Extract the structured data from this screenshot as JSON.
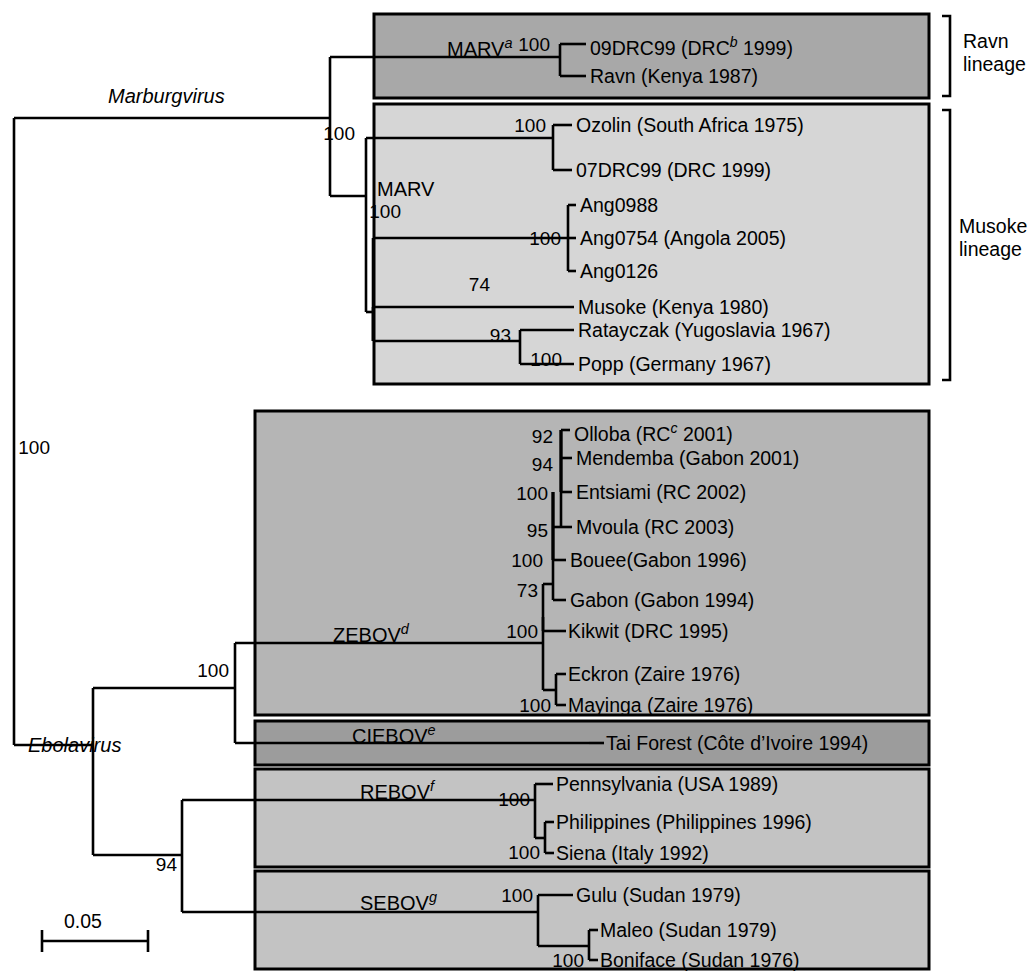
{
  "figure": {
    "type": "phylogenetic-tree",
    "scale_bar": {
      "label": "0.05",
      "units": "substitutions per site"
    },
    "genera": [
      {
        "id": "marburgvirus",
        "name": "Marburgvirus"
      },
      {
        "id": "ebolavirus",
        "name": "Ebolavirus"
      }
    ],
    "lineage_brackets": [
      {
        "id": "ravn",
        "label": "Ravn\nlineage",
        "line1": "Ravn",
        "line2": "lineage"
      },
      {
        "id": "musoke",
        "label": "Musoke\nlineage",
        "line1": "Musoke",
        "line2": "lineage"
      }
    ],
    "clade_boxes": [
      {
        "id": "ravn-box",
        "label": "MARV",
        "superscript": "a",
        "shade": "#a8a8a8"
      },
      {
        "id": "musoke-box",
        "label": "MARV",
        "superscript": "",
        "shade": "#d4d4d4"
      },
      {
        "id": "zebov-box",
        "label": "ZEBOV",
        "superscript": "d",
        "shade": "#b4b4b4"
      },
      {
        "id": "ciebov-box",
        "label": "CIEBOV",
        "superscript": "e",
        "shade": "#9a9a9a"
      },
      {
        "id": "rebov-box",
        "label": "REBOV",
        "superscript": "f",
        "shade": "#c2c2c2"
      },
      {
        "id": "sebov-box",
        "label": "SEBOV",
        "superscript": "g",
        "shade": "#c2c2c2"
      }
    ],
    "taxa": [
      {
        "id": "t01",
        "label": "09DRC99 (DRC",
        "superscript": "b",
        "tail": " 1999)",
        "clade": "ravn-box"
      },
      {
        "id": "t02",
        "label": "Ravn (Kenya 1987)",
        "superscript": "",
        "tail": "",
        "clade": "ravn-box"
      },
      {
        "id": "t03",
        "label": "Ozolin (South Africa 1975)",
        "superscript": "",
        "tail": "",
        "clade": "musoke-box"
      },
      {
        "id": "t04",
        "label": "07DRC99 (DRC 1999)",
        "superscript": "",
        "tail": "",
        "clade": "musoke-box"
      },
      {
        "id": "t05",
        "label": "Ang0988",
        "superscript": "",
        "tail": "",
        "clade": "musoke-box"
      },
      {
        "id": "t06",
        "label": "Ang0754 (Angola 2005)",
        "superscript": "",
        "tail": "",
        "clade": "musoke-box"
      },
      {
        "id": "t07",
        "label": "Ang0126",
        "superscript": "",
        "tail": "",
        "clade": "musoke-box"
      },
      {
        "id": "t08",
        "label": "Musoke (Kenya 1980)",
        "superscript": "",
        "tail": "",
        "clade": "musoke-box"
      },
      {
        "id": "t09",
        "label": "Ratayczak (Yugoslavia 1967)",
        "superscript": "",
        "tail": "",
        "clade": "musoke-box"
      },
      {
        "id": "t10",
        "label": "Popp (Germany 1967)",
        "superscript": "",
        "tail": "",
        "clade": "musoke-box"
      },
      {
        "id": "t11",
        "label": "Olloba (RC",
        "superscript": "c",
        "tail": " 2001)",
        "clade": "zebov-box"
      },
      {
        "id": "t12",
        "label": "Mendemba (Gabon 2001)",
        "superscript": "",
        "tail": "",
        "clade": "zebov-box"
      },
      {
        "id": "t13",
        "label": "Entsiami (RC 2002)",
        "superscript": "",
        "tail": "",
        "clade": "zebov-box"
      },
      {
        "id": "t14",
        "label": "Mvoula (RC 2003)",
        "superscript": "",
        "tail": "",
        "clade": "zebov-box"
      },
      {
        "id": "t15",
        "label": "Bouee(Gabon 1996)",
        "superscript": "",
        "tail": "",
        "clade": "zebov-box"
      },
      {
        "id": "t16",
        "label": "Gabon (Gabon 1994)",
        "superscript": "",
        "tail": "",
        "clade": "zebov-box"
      },
      {
        "id": "t17",
        "label": "Kikwit (DRC 1995)",
        "superscript": "",
        "tail": "",
        "clade": "zebov-box"
      },
      {
        "id": "t18",
        "label": "Eckron (Zaire 1976)",
        "superscript": "",
        "tail": "",
        "clade": "zebov-box"
      },
      {
        "id": "t19",
        "label": "Mayinga (Zaire 1976)",
        "superscript": "",
        "tail": "",
        "clade": "zebov-box"
      },
      {
        "id": "t20",
        "label": "Tai Forest (Côte d’Ivoire 1994)",
        "superscript": "",
        "tail": "",
        "clade": "ciebov-box"
      },
      {
        "id": "t21",
        "label": "Pennsylvania (USA 1989)",
        "superscript": "",
        "tail": "",
        "clade": "rebov-box"
      },
      {
        "id": "t22",
        "label": "Philippines (Philippines 1996)",
        "superscript": "",
        "tail": "",
        "clade": "rebov-box"
      },
      {
        "id": "t23",
        "label": "Siena (Italy 1992)",
        "superscript": "",
        "tail": "",
        "clade": "rebov-box"
      },
      {
        "id": "t24",
        "label": "Gulu (Sudan 1979)",
        "superscript": "",
        "tail": "",
        "clade": "sebov-box"
      },
      {
        "id": "t25",
        "label": "Maleo (Sudan 1979)",
        "superscript": "",
        "tail": "",
        "clade": "sebov-box"
      },
      {
        "id": "t26",
        "label": "Boniface (Sudan 1976)",
        "superscript": "",
        "tail": "",
        "clade": "sebov-box"
      }
    ],
    "bootstrap_values": [
      {
        "id": "b-root",
        "value": "100",
        "node": "filovirus-root"
      },
      {
        "id": "b-marv",
        "value": "100",
        "node": "marburgvirus-crown"
      },
      {
        "id": "b-ravn",
        "value": "100",
        "node": "ravn-pair"
      },
      {
        "id": "b-ozolin",
        "value": "100",
        "node": "ozolin-07drc99"
      },
      {
        "id": "b-musoke-crown",
        "value": "100",
        "node": "musoke-crown"
      },
      {
        "id": "b-angola",
        "value": "100",
        "node": "angola-trio"
      },
      {
        "id": "b-74",
        "value": "74",
        "node": "musoke-subclade"
      },
      {
        "id": "b-93",
        "value": "93",
        "node": "musoke-ratayczak-popp"
      },
      {
        "id": "b-100-popp",
        "value": "100",
        "node": "ratayczak-popp"
      },
      {
        "id": "b-92",
        "value": "92",
        "node": "olloba-node"
      },
      {
        "id": "b-94-mend",
        "value": "94",
        "node": "mendemba-node"
      },
      {
        "id": "b-100-ents",
        "value": "100",
        "node": "entsiami-node"
      },
      {
        "id": "b-95",
        "value": "95",
        "node": "mvoula-node"
      },
      {
        "id": "b-100-bouee",
        "value": "100",
        "node": "bouee-node"
      },
      {
        "id": "b-73",
        "value": "73",
        "node": "gabon-node"
      },
      {
        "id": "b-100-zebov",
        "value": "100",
        "node": "zebov-crown"
      },
      {
        "id": "b-100-mayinga",
        "value": "100",
        "node": "eckron-mayinga"
      },
      {
        "id": "b-100-ebola",
        "value": "100",
        "node": "zebov-ciebov"
      },
      {
        "id": "b-100-rebov",
        "value": "100",
        "node": "rebov-crown"
      },
      {
        "id": "b-100-siena",
        "value": "100",
        "node": "philippines-siena"
      },
      {
        "id": "b-94-ebola",
        "value": "94",
        "node": "rebov-sebov"
      },
      {
        "id": "b-100-sebov",
        "value": "100",
        "node": "sebov-crown"
      },
      {
        "id": "b-100-boni",
        "value": "100",
        "node": "maleo-boniface"
      }
    ],
    "colors": {
      "stroke": "#000000",
      "background": "#ffffff"
    }
  }
}
